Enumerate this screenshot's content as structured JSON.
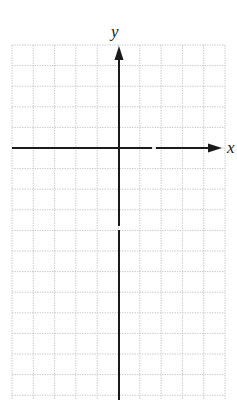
{
  "diagram": {
    "type": "coordinate-plane-blank-grid",
    "x_axis_label": "x",
    "y_axis_label": "y",
    "grid": {
      "columns": 10,
      "rows_visible": 17,
      "line_color": "#c8c8c8",
      "line_style": "dotted"
    },
    "axes": {
      "color": "#1a1a1a",
      "x_axis_arrow": "right",
      "y_axis_arrow": "up"
    },
    "background": "#ffffff"
  }
}
